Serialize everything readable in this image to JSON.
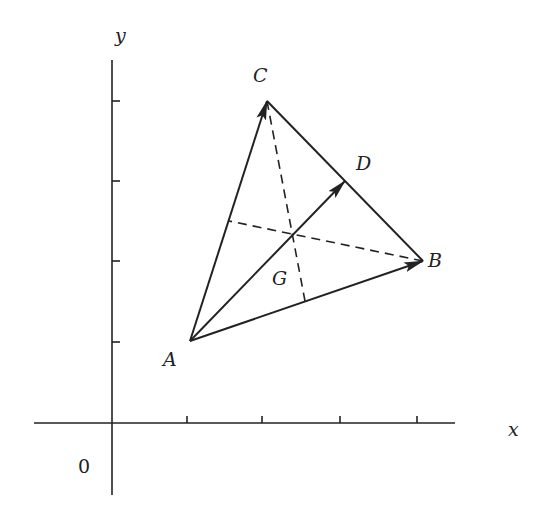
{
  "diagram": {
    "title": "",
    "axes": {
      "x_label": "x",
      "y_label": "y",
      "origin_label": "0",
      "x_ticks": [
        1,
        2,
        3,
        4
      ],
      "y_ticks": [
        1,
        2,
        3,
        4
      ]
    },
    "points": {
      "A": {
        "label": "A",
        "coords": [
          1,
          1
        ]
      },
      "B": {
        "label": "B",
        "coords": [
          4,
          2
        ]
      },
      "C": {
        "label": "C",
        "coords": [
          2,
          4
        ]
      },
      "D": {
        "label": "D",
        "coords": [
          3,
          3
        ],
        "note": "midpoint of BC"
      },
      "G": {
        "label": "G",
        "coords": [
          2.333,
          2.333
        ],
        "note": "centroid"
      }
    },
    "vectors": [
      {
        "from": "A",
        "to": "B",
        "style": "solid-arrow"
      },
      {
        "from": "A",
        "to": "C",
        "style": "solid-arrow"
      },
      {
        "from": "A",
        "to": "D",
        "style": "solid-arrow"
      }
    ],
    "segments": [
      {
        "from": "C",
        "to": "B",
        "style": "solid"
      },
      {
        "from": "C",
        "to": "mid-AB",
        "style": "dashed"
      },
      {
        "from": "B",
        "to": "mid-AC",
        "style": "dashed"
      }
    ],
    "colors": {
      "ink": "#222222",
      "background": "#ffffff"
    }
  }
}
